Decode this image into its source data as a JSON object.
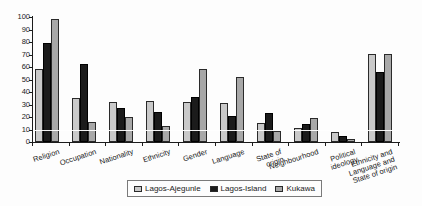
{
  "chart_data": {
    "type": "bar",
    "title": "",
    "xlabel": "",
    "ylabel": "",
    "ylim": [
      0,
      100
    ],
    "ytick_step": 10,
    "grid": "single white gridline at 10 drawn over bars",
    "legend_position": "bottom-center",
    "categories": [
      "Religion",
      "Occupation",
      "Nationality",
      "Ethnicity",
      "Gender",
      "Language",
      "State of\norigin",
      "Neighbourhood",
      "Political\nideology",
      "Ethnicity and\nLanguage and\nState of origin"
    ],
    "series": [
      {
        "name": "Lagos-Ajegunle",
        "color": "#c9c9c9",
        "border": "#2a2a2a",
        "values": [
          58,
          35,
          32,
          33,
          32,
          31,
          15,
          11,
          8,
          70
        ]
      },
      {
        "name": "Lagos-Island",
        "color": "#1b1b1b",
        "border": "#000000",
        "values": [
          79,
          62,
          27,
          24,
          36,
          21,
          23,
          14,
          5,
          56
        ]
      },
      {
        "name": "Kukawa",
        "color": "#a8a8a8",
        "border": "#2a2a2a",
        "values": [
          98,
          16,
          20,
          13,
          58,
          52,
          9,
          19,
          2,
          70
        ]
      }
    ]
  },
  "colors": {
    "axis": "#1c1c1c",
    "text": "#222222",
    "background": "#fdfdfd",
    "legend_border": "#7a7a7a",
    "overlay_gridline": "#ffffff"
  }
}
